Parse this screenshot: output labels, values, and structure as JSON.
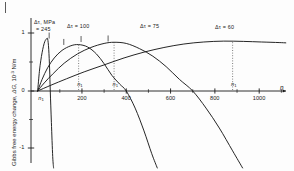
{
  "chart_data": {
    "type": "line",
    "title": "",
    "xlabel": "n",
    "ylabel_main": "Gibbs free energy change,",
    "ylabel_symbol": "ΔG",
    "ylabel_units": ", 10",
    "ylabel_exp": "-3",
    "ylabel_tail": " N/m",
    "xlim": [
      -30,
      1130
    ],
    "ylim": [
      -1.35,
      1.25
    ],
    "grid": false,
    "legend_position": "inline-above-curves",
    "xticks": [
      200,
      400,
      600,
      800,
      1000
    ],
    "xtick_labels": [
      "200",
      "400",
      "600",
      "800",
      "1000"
    ],
    "xminor_ticks": [
      100,
      300,
      500,
      700,
      900,
      1100
    ],
    "yticks": [
      1,
      0,
      -1
    ],
    "ytick_labels": [
      "1",
      "0",
      "-1"
    ],
    "series": [
      {
        "name": "Δτ = 245",
        "label_line1": "Δτ, MPa",
        "label_line2": "= 245",
        "peak_n": 45,
        "peak_dG": 0.9,
        "zero_crossing_n": 57,
        "n1_marker": 10,
        "points": [
          [
            0,
            0
          ],
          [
            8,
            0.34
          ],
          [
            14,
            0.52
          ],
          [
            20,
            0.66
          ],
          [
            26,
            0.77
          ],
          [
            32,
            0.85
          ],
          [
            38,
            0.89
          ],
          [
            45,
            0.9
          ],
          [
            50,
            0.72
          ],
          [
            54,
            0.38
          ],
          [
            57,
            0.0
          ],
          [
            62,
            -0.55
          ],
          [
            68,
            -1.15
          ],
          [
            72,
            -1.35
          ]
        ]
      },
      {
        "name": "Δτ = 100",
        "label_line1": "Δτ = 100",
        "peak_n": 185,
        "peak_dG": 0.8,
        "zero_crossing_n": 400,
        "n1_marker": 185,
        "points": [
          [
            0,
            0
          ],
          [
            20,
            0.2
          ],
          [
            45,
            0.4
          ],
          [
            75,
            0.57
          ],
          [
            110,
            0.7
          ],
          [
            150,
            0.78
          ],
          [
            185,
            0.8
          ],
          [
            225,
            0.76
          ],
          [
            265,
            0.64
          ],
          [
            300,
            0.47
          ],
          [
            335,
            0.27
          ],
          [
            370,
            0.12
          ],
          [
            400,
            0.0
          ],
          [
            440,
            -0.3
          ],
          [
            480,
            -0.7
          ],
          [
            515,
            -1.1
          ],
          [
            540,
            -1.35
          ]
        ]
      },
      {
        "name": "Δτ = 75",
        "label_line1": "Δτ = 75",
        "peak_n": 345,
        "peak_dG": 0.84,
        "zero_crossing_n": 700,
        "n1_marker": 345,
        "points": [
          [
            0,
            0
          ],
          [
            30,
            0.14
          ],
          [
            70,
            0.3
          ],
          [
            120,
            0.48
          ],
          [
            180,
            0.64
          ],
          [
            240,
            0.75
          ],
          [
            300,
            0.82
          ],
          [
            345,
            0.84
          ],
          [
            400,
            0.82
          ],
          [
            460,
            0.73
          ],
          [
            520,
            0.6
          ],
          [
            580,
            0.42
          ],
          [
            640,
            0.2
          ],
          [
            700,
            0.0
          ],
          [
            760,
            -0.3
          ],
          [
            820,
            -0.65
          ],
          [
            880,
            -1.05
          ],
          [
            925,
            -1.35
          ]
        ]
      },
      {
        "name": "Δτ = 60",
        "label_line1": "Δτ = 60",
        "peak_n": 880,
        "peak_dG": 0.86,
        "n1_marker": 880,
        "points": [
          [
            0,
            0
          ],
          [
            60,
            0.1
          ],
          [
            130,
            0.21
          ],
          [
            210,
            0.33
          ],
          [
            300,
            0.45
          ],
          [
            390,
            0.57
          ],
          [
            480,
            0.67
          ],
          [
            570,
            0.75
          ],
          [
            660,
            0.81
          ],
          [
            750,
            0.845
          ],
          [
            840,
            0.86
          ],
          [
            930,
            0.855
          ],
          [
            1010,
            0.845
          ],
          [
            1090,
            0.835
          ],
          [
            1120,
            0.83
          ]
        ]
      }
    ],
    "dotted_markers": [
      {
        "n": 185,
        "label": "n",
        "sub": "1",
        "to_dG": 0.8
      },
      {
        "n": 345,
        "label": "n",
        "sub": "1",
        "to_dG": 0.84
      },
      {
        "n": 880,
        "label": "n",
        "sub": "1",
        "to_dG": 0.86
      }
    ],
    "axis_n1_label": {
      "label": "n",
      "sub": "1",
      "n": 10
    },
    "colors": {
      "axis": "#1a1a1a",
      "curve": "#1a1a1a",
      "dotted": "#555555",
      "background": "#fdfdfd"
    }
  }
}
